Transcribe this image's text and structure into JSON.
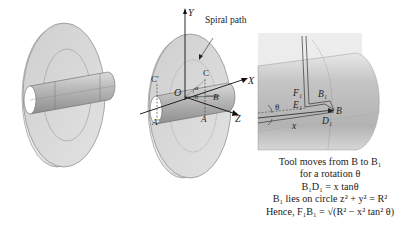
{
  "figure": {
    "panel_left": {
      "description": "Disc workpiece with cylindrical tool shaft passing through"
    },
    "panel_middle": {
      "labels": {
        "y_axis": "Y",
        "x_axis": "X",
        "z_axis": "Z",
        "origin": "O",
        "spiral_path": "Spiral path",
        "point_c": "C",
        "point_c_prime": "C'",
        "point_a": "A",
        "point_a_prime": "A'",
        "point_b": "B",
        "angle_alpha": "α",
        "angle_theta": "θ"
      }
    },
    "panel_right": {
      "labels": {
        "f1": "F₁",
        "e1": "E₁",
        "b1": "B₁",
        "b": "B",
        "d1": "D₁",
        "x": "x",
        "theta": "θ"
      }
    },
    "caption": {
      "line1": "Tool moves from B to B₁",
      "line2": "for a rotation θ",
      "line3": "B₁D₁ = x tanθ",
      "line4": "B₁ lies on circle z² + y² = R²",
      "line5": "Hence, F₁B₁ = √(R² − x² tan² θ)"
    }
  }
}
